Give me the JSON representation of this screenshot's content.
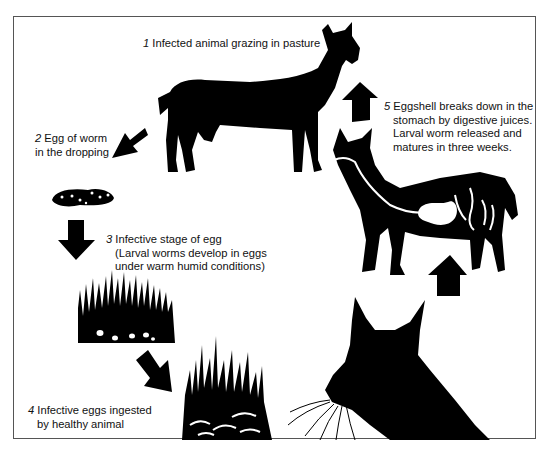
{
  "diagram": {
    "type": "life-cycle",
    "colors": {
      "ink": "#000000",
      "background": "#ffffff",
      "frame": "#555555"
    },
    "steps": [
      {
        "number": "1",
        "lines": [
          "Infected animal grazing in pasture"
        ]
      },
      {
        "number": "2",
        "lines": [
          "Egg of worm",
          "in the dropping"
        ]
      },
      {
        "number": "3",
        "lines": [
          "Infective stage of egg",
          "(Larval worms develop in eggs",
          "under warm humid conditions)"
        ]
      },
      {
        "number": "4",
        "lines": [
          "Infective eggs ingested",
          "by healthy animal"
        ]
      },
      {
        "number": "5",
        "lines": [
          "Eggshell breaks down in the",
          "stomach by digestive juices.",
          "Larval worm released and",
          "matures in three weeks."
        ]
      }
    ],
    "illustrations": [
      "infected-goat-silhouette",
      "dropping-with-eggs",
      "grass-with-eggs",
      "grass-with-ingested-eggs",
      "grazing-goat-head",
      "goat-digestive-tract-cutaway"
    ],
    "arrows": [
      "arrow-goat-to-dropping",
      "arrow-dropping-to-grass",
      "arrow-grass-to-ingestion",
      "arrow-head-to-cutaway",
      "arrow-cutaway-to-infected-goat"
    ]
  }
}
